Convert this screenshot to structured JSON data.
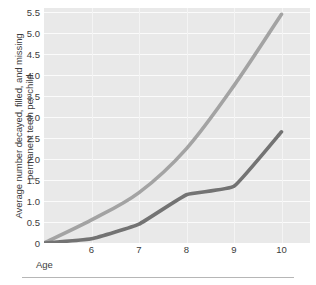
{
  "chart_data": {
    "type": "line",
    "title": "",
    "subtitle": "",
    "xlabel": "Age",
    "ylabel": "Average number decayed, filled, and missing permanent teeth per child.",
    "ylabel_lines": [
      "Average number decayed, filled, and missing",
      "permanent teeth per child."
    ],
    "x": [
      5,
      6,
      7,
      8,
      9,
      10
    ],
    "xlim": [
      5,
      10.6
    ],
    "ylim": [
      0,
      5.6
    ],
    "xtick_labels": [
      "6",
      "7",
      "8",
      "9",
      "10"
    ],
    "xticks": [
      6,
      7,
      8,
      9,
      10
    ],
    "ytick_labels": [
      "0",
      "0.5",
      "1.0",
      "1.5",
      "2.0",
      "2.5",
      "3.0",
      "3.5",
      "4.0",
      "4.5",
      "5.0",
      "5.5"
    ],
    "yticks": [
      0,
      0.5,
      1.0,
      1.5,
      2.0,
      2.5,
      3.0,
      3.5,
      4.0,
      4.5,
      5.0,
      5.5
    ],
    "grid": "horizontal-and-vertical",
    "legend": "none",
    "plot_background": "#e9e9e9",
    "gridline_color": "#fbfbfb",
    "series": [
      {
        "name": "upper-series",
        "color": "#a3a3a3",
        "line_width": 3.6,
        "values": [
          0.0,
          0.55,
          1.2,
          2.25,
          3.75,
          5.45
        ]
      },
      {
        "name": "lower-series",
        "color": "#737373",
        "line_width": 3.6,
        "values": [
          0.0,
          0.1,
          0.45,
          1.15,
          1.35,
          2.65
        ]
      }
    ]
  },
  "figure": {
    "background": "#ffffff",
    "rule_color": "#b6b6b6"
  }
}
